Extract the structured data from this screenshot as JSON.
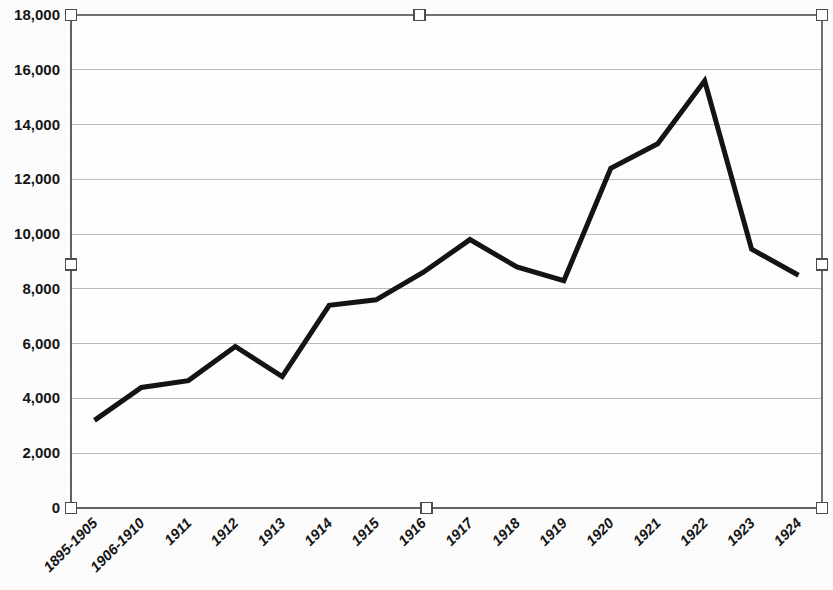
{
  "chart_data": {
    "type": "line",
    "title": "",
    "subtitle": "",
    "xlabel": "",
    "ylabel": "",
    "categories": [
      "1895-1905",
      "1906-1910",
      "1911",
      "1912",
      "1913",
      "1914",
      "1915",
      "1916",
      "1917",
      "1918",
      "1919",
      "1920",
      "1921",
      "1922",
      "1923",
      "1924"
    ],
    "values": [
      3200,
      4400,
      4650,
      5900,
      4800,
      7400,
      7600,
      8600,
      9800,
      8800,
      8300,
      12400,
      13300,
      15600,
      9450,
      8500
    ],
    "series": [
      {
        "name": "Series 1",
        "values": [
          3200,
          4400,
          4650,
          5900,
          4800,
          7400,
          7600,
          8600,
          9800,
          8800,
          8300,
          12400,
          13300,
          15600,
          9450,
          8500
        ],
        "color": "#141414"
      }
    ],
    "ylim": [
      0,
      18000
    ],
    "ytick_values": [
      0,
      2000,
      4000,
      6000,
      8000,
      10000,
      12000,
      14000,
      16000,
      18000
    ],
    "ytick_labels": [
      "0",
      "2,000",
      "4,000",
      "6,000",
      "8,000",
      "10,000",
      "12,000",
      "14,000",
      "16,000",
      "18,000"
    ],
    "grid": true,
    "grid_axis": "y",
    "legend": false,
    "legend_position": "none",
    "xtick_rotation_degrees": 45,
    "line_color": "#141414",
    "gridline_color": "#b9bcc2",
    "axis_color": "#5f6266",
    "background_color": "#ffffff"
  },
  "selection": {
    "selected": true,
    "handle_count": 6,
    "handle_fill": "#ffffff",
    "handle_stroke": "#4a4d51"
  }
}
